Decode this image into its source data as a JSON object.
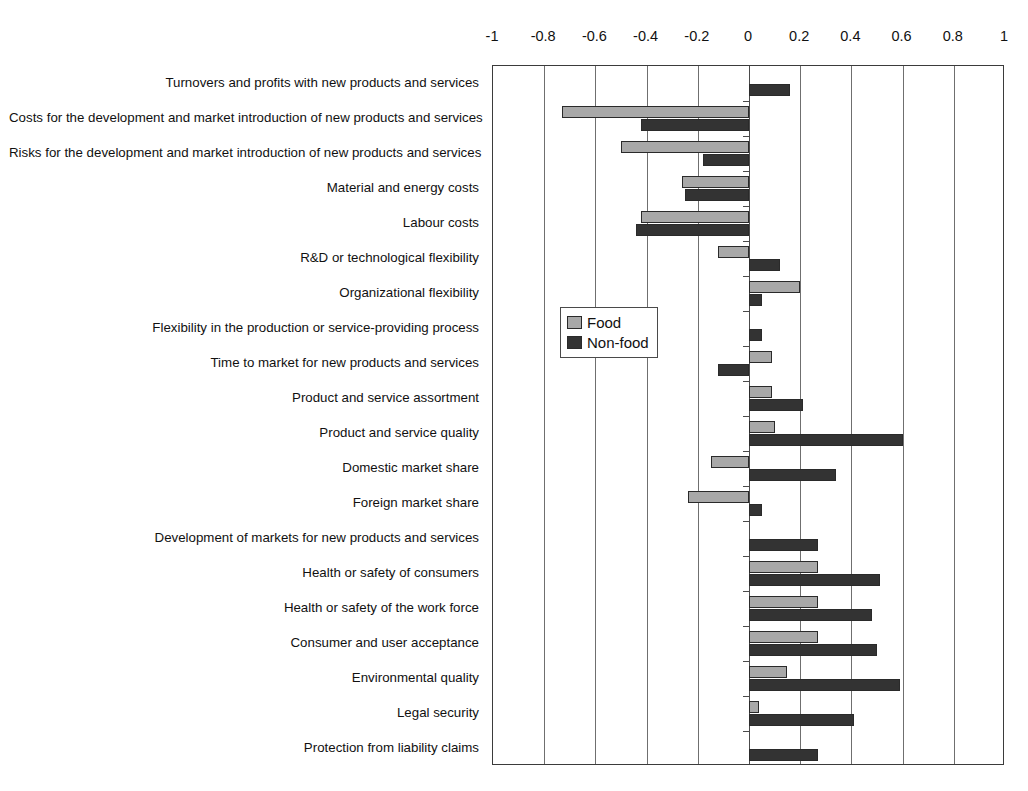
{
  "chart_data": {
    "type": "bar",
    "orientation": "horizontal",
    "title": "",
    "subtitle": "",
    "xlabel": "",
    "ylabel": "",
    "xlim": [
      -1,
      1
    ],
    "grid": true,
    "axis_position": "top",
    "legend": {
      "position": "inside-left-middle",
      "entries": [
        {
          "name": "Food",
          "color": "#a8a8a8"
        },
        {
          "name": "Non-food",
          "color": "#333333"
        }
      ]
    },
    "xticks": [
      -1,
      -0.8,
      -0.6,
      -0.4,
      -0.2,
      0,
      0.2,
      0.4,
      0.6,
      0.8,
      1
    ],
    "xtick_labels": [
      "-1",
      "-0.8",
      "-0.6",
      "-0.4",
      "-0.2",
      "0",
      "0.2",
      "0.4",
      "0.6",
      "0.8",
      "1"
    ],
    "categories": [
      "Turnovers and profits with new products and services",
      "Costs for the development and market introduction of new products and services",
      "Risks for the development and market introduction of new products and services",
      "Material and energy costs",
      "Labour costs",
      "R&D or technological flexibility",
      "Organizational flexibility",
      "Flexibility in the production or service-providing process",
      "Time to market for new products and services",
      "Product and service assortment",
      "Product and service quality",
      "Domestic market share",
      "Foreign market share",
      "Development of markets for new products and services",
      "Health or safety of consumers",
      "Health or safety of the work force",
      "Consumer and user acceptance",
      "Environmental quality",
      "Legal security",
      "Protection from liability claims"
    ],
    "series": [
      {
        "name": "Food",
        "color": "#a8a8a8",
        "values": [
          0,
          -0.73,
          -0.5,
          -0.26,
          -0.42,
          -0.12,
          0.2,
          0,
          0.09,
          0.09,
          0.1,
          -0.15,
          -0.24,
          0,
          0.27,
          0.27,
          0.27,
          0.15,
          0.04,
          0
        ]
      },
      {
        "name": "Non-food",
        "color": "#333333",
        "values": [
          0.16,
          -0.42,
          -0.18,
          -0.25,
          -0.44,
          0.12,
          0.05,
          0.05,
          -0.12,
          0.21,
          0.6,
          0.34,
          0.05,
          0.27,
          0.51,
          0.48,
          0.5,
          0.59,
          0.41,
          0.27
        ]
      }
    ]
  }
}
